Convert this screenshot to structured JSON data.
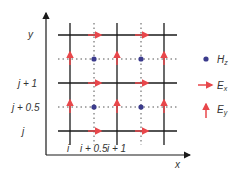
{
  "diagram": {
    "axes": {
      "x_label": "x",
      "y_label": "y"
    },
    "y_ticks": [
      {
        "text": "j",
        "y": 131
      },
      {
        "text": "j + 0.5",
        "y": 107
      },
      {
        "text": "j + 1",
        "y": 83
      }
    ],
    "x_ticks": [
      {
        "text": "i",
        "x": 70
      },
      {
        "text": "i + 0.5",
        "x": 94
      },
      {
        "text": "i + 1",
        "x": 117
      }
    ],
    "legend": [
      {
        "symbol": "dot",
        "label": "H",
        "sub": "z",
        "color": "#3b3b8c"
      },
      {
        "symbol": "arrow-right",
        "label": "E",
        "sub": "x",
        "color": "#e8474b"
      },
      {
        "symbol": "arrow-up",
        "label": "E",
        "sub": "y",
        "color": "#e8474b"
      }
    ],
    "colors": {
      "grid": "#1a1a1a",
      "hz": "#3b3b8c",
      "e": "#e8474b",
      "dotted": "#555555"
    }
  }
}
